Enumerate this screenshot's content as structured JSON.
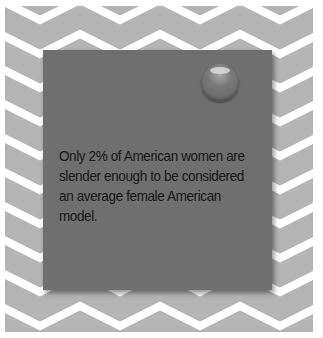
{
  "background": {
    "pattern": "chevron",
    "stripe_color": "#b4b4b4",
    "gap_color": "#ffffff"
  },
  "card": {
    "color": "#6f6f6f",
    "pin_icon": "pushpin-icon",
    "fact_text": "Only 2% of American women are slender enough to be considered an average female American model."
  }
}
